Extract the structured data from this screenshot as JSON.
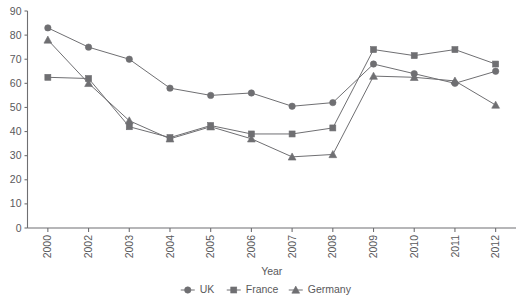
{
  "chart_data": {
    "type": "line",
    "title": "",
    "xlabel": "Year",
    "ylabel": "",
    "categories": [
      "2000",
      "2002",
      "2003",
      "2004",
      "2005",
      "2006",
      "2007",
      "2008",
      "2009",
      "2010",
      "2011",
      "2012"
    ],
    "series": [
      {
        "name": "UK",
        "marker": "circle",
        "color": "#6f6f72",
        "values": [
          83,
          75,
          70,
          58,
          55,
          56,
          50.5,
          52,
          68,
          64,
          60,
          65
        ]
      },
      {
        "name": "France",
        "marker": "square",
        "color": "#6f6f72",
        "values": [
          62.5,
          62,
          42,
          37.5,
          42.5,
          39,
          39,
          41.5,
          74,
          71.5,
          74,
          68
        ]
      },
      {
        "name": "Germany",
        "marker": "triangle",
        "color": "#6f6f72",
        "values": [
          78,
          60,
          44.5,
          37,
          42,
          37,
          29.5,
          30.5,
          63,
          62.5,
          61,
          51
        ]
      }
    ],
    "ylim": [
      0,
      90
    ],
    "yticks": [
      0,
      10,
      20,
      30,
      40,
      50,
      60,
      70,
      80,
      90
    ],
    "ytick_labels": [
      "0",
      "10",
      "20",
      "30",
      "40",
      "50",
      "60",
      "70",
      "80",
      "90"
    ],
    "grid": false,
    "legend_position": "bottom",
    "xtick_rotation": 90
  },
  "legend": {
    "items": [
      {
        "label": "UK",
        "marker": "circle-marker"
      },
      {
        "label": "France",
        "marker": "square-marker"
      },
      {
        "label": "Germany",
        "marker": "triangle-marker"
      }
    ]
  },
  "axis": {
    "x_title": "Year"
  }
}
